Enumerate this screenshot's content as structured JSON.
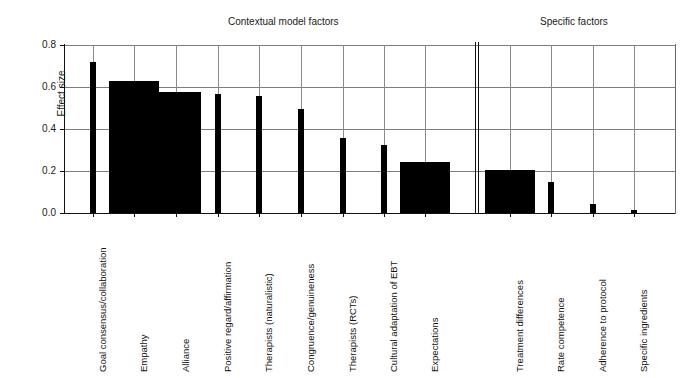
{
  "chart_data": {
    "type": "bar",
    "title": "",
    "xlabel": "",
    "ylabel": "Effect size",
    "ylim": [
      0.0,
      0.8
    ],
    "ytick_labels": [
      "0.0",
      "0.2",
      "0.4",
      "0.6",
      "0.8"
    ],
    "ytick_values": [
      0.0,
      0.2,
      0.4,
      0.6,
      0.8
    ],
    "grid": true,
    "legend": "none",
    "group_labels": [
      {
        "text": "Contextual model factors",
        "span": [
          0,
          8
        ]
      },
      {
        "text": "Specific factors",
        "span": [
          9,
          12
        ]
      }
    ],
    "categories": [
      "Goal consensus/collaboration",
      "Empathy",
      "Alliance",
      "Positive regard/affirmation",
      "Therapists (naturalistic)",
      "Congruence/genuineness",
      "Therapists (RCTs)",
      "Cultural adaptation of EBT",
      "Expectations",
      "Treatment differences",
      "Rate competence",
      "Adherence to protocol",
      "Specific ingredients"
    ],
    "values": [
      0.72,
      0.63,
      0.575,
      0.565,
      0.555,
      0.495,
      0.355,
      0.325,
      0.245,
      0.205,
      0.15,
      0.045,
      0.015
    ],
    "bar_widths": [
      "thin",
      "wide",
      "wide",
      "thin",
      "thin",
      "thin",
      "thin",
      "thin",
      "wide",
      "wide",
      "thin",
      "thin",
      "thin"
    ]
  },
  "axis": {
    "y_title": "Effect size"
  }
}
